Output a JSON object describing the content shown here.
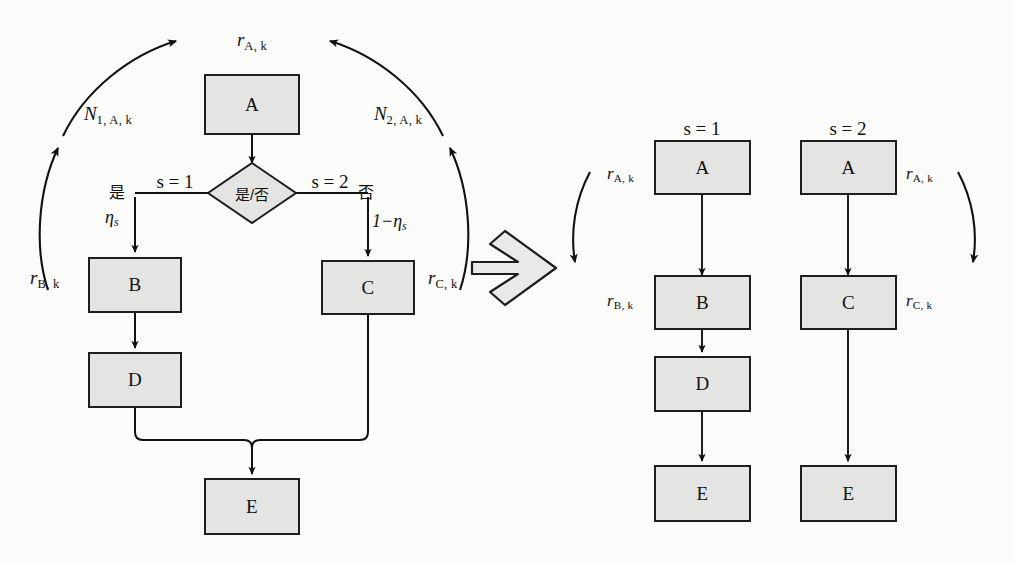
{
  "diagram": {
    "type": "flowchart-transformation",
    "background_color": "#fbfbfa",
    "node_fill_color": "#e4e4e2",
    "node_stroke_color": "#1d1d1d"
  },
  "left_panel": {
    "nodes": {
      "a": "A",
      "decision": "是/否",
      "b": "B",
      "c": "C",
      "d": "D",
      "e": "E"
    },
    "branch_labels": {
      "left_condition": "是",
      "right_condition": "否",
      "left_state": "s = 1",
      "right_state": "s = 2",
      "left_prob": "η",
      "left_prob_sub": "s",
      "right_prob": "1−η",
      "right_prob_sub": "s"
    },
    "feedback_labels": {
      "top": {
        "base": "r",
        "sub": "A, k"
      },
      "left_outer": {
        "base": "N",
        "sub": "1, A, k"
      },
      "right_outer": {
        "base": "N",
        "sub": "2, A, k"
      },
      "left_inner": {
        "base": "r",
        "sub": "B, k"
      },
      "right_inner": {
        "base": "r",
        "sub": "C, k"
      }
    }
  },
  "transform_arrow": {
    "name": "block-arrow-right",
    "direction": "right"
  },
  "right_panel": {
    "columns": [
      {
        "header": "s = 1",
        "nodes": [
          "A",
          "B",
          "D",
          "E"
        ],
        "rate_labels": [
          {
            "base": "r",
            "sub": "A, k"
          },
          {
            "base": "r",
            "sub": "B, k"
          }
        ],
        "curved_arrow_side": "left"
      },
      {
        "header": "s = 2",
        "nodes": [
          "A",
          "C",
          "E"
        ],
        "rate_labels": [
          {
            "base": "r",
            "sub": "A, k"
          },
          {
            "base": "r",
            "sub": "C, k"
          }
        ],
        "curved_arrow_side": "right"
      }
    ]
  }
}
